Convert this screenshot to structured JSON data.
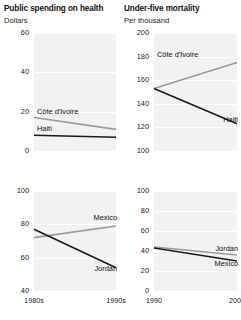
{
  "colors": {
    "plot_background": "#f2f2f2",
    "gridline": "#ffffff",
    "dark_series": "#1a1a1a",
    "light_series": "#9a9a9a",
    "text": "#1a1a1a",
    "page_background": "#ffffff"
  },
  "panels": {
    "top_left": {
      "title": "Public spending on health",
      "subtitle": "Dollars"
    },
    "top_right": {
      "title": "Under-five mortality",
      "subtitle": "Per thousand"
    }
  },
  "chart_data": [
    {
      "id": "spending-upper",
      "type": "line",
      "title": "Public spending on health",
      "subtitle": "Dollars",
      "ylabel": "Dollars",
      "xlabel": "",
      "x": [
        "1980s",
        "1990s"
      ],
      "xticks": [
        "",
        ""
      ],
      "yticks": [
        0,
        20,
        40,
        60
      ],
      "ylim": [
        0,
        60
      ],
      "grid": true,
      "legend": "inline-labels",
      "series": [
        {
          "name": "Côte d'Ivoire",
          "values": [
            17,
            11
          ],
          "color": "#9a9a9a",
          "label_x": "1980s",
          "label_y": 20
        },
        {
          "name": "Haiti",
          "values": [
            8,
            7
          ],
          "color": "#1a1a1a",
          "label_x": "1980s",
          "label_y": 11
        }
      ]
    },
    {
      "id": "mortality-upper",
      "type": "line",
      "title": "Under-five mortality",
      "subtitle": "Per thousand",
      "ylabel": "Per thousand",
      "xlabel": "",
      "x": [
        "1990",
        "2000"
      ],
      "xticks": [
        "",
        ""
      ],
      "yticks": [
        100,
        120,
        140,
        160,
        180,
        200
      ],
      "ylim": [
        100,
        200
      ],
      "grid": true,
      "legend": "inline-labels",
      "series": [
        {
          "name": "Côte d'Ivoire",
          "values": [
            153,
            175
          ],
          "color": "#9a9a9a",
          "label_x": "1990",
          "label_y": 181
        },
        {
          "name": "Haiti",
          "values": [
            153,
            123
          ],
          "color": "#1a1a1a",
          "label_x": "2000",
          "label_y": 126
        }
      ]
    },
    {
      "id": "spending-lower",
      "type": "line",
      "title": "",
      "subtitle": "",
      "ylabel": "Dollars",
      "xlabel": "",
      "x": [
        "1980s",
        "1990s"
      ],
      "xticks": [
        "1980s",
        "1990s"
      ],
      "yticks": [
        40,
        60,
        80,
        100
      ],
      "ylim": [
        40,
        100
      ],
      "grid": true,
      "legend": "inline-labels",
      "series": [
        {
          "name": "Mexico",
          "values": [
            72,
            79
          ],
          "color": "#9a9a9a",
          "label_x": "1990s",
          "label_y": 84
        },
        {
          "name": "Jordan",
          "values": [
            77,
            54
          ],
          "color": "#1a1a1a",
          "label_x": "1990s",
          "label_y": 53
        }
      ]
    },
    {
      "id": "mortality-lower",
      "type": "line",
      "title": "",
      "subtitle": "",
      "ylabel": "Per thousand",
      "xlabel": "",
      "x": [
        "1990",
        "2000"
      ],
      "xticks": [
        "1990",
        "2000"
      ],
      "yticks": [
        0,
        20,
        40,
        60,
        80,
        100
      ],
      "ylim": [
        0,
        100
      ],
      "grid": true,
      "legend": "inline-labels",
      "series": [
        {
          "name": "Jordan",
          "values": [
            44,
            36
          ],
          "color": "#9a9a9a",
          "label_x": "2000",
          "label_y": 42
        },
        {
          "name": "Mexico",
          "values": [
            43,
            30
          ],
          "color": "#1a1a1a",
          "label_x": "2000",
          "label_y": 27
        }
      ]
    }
  ]
}
